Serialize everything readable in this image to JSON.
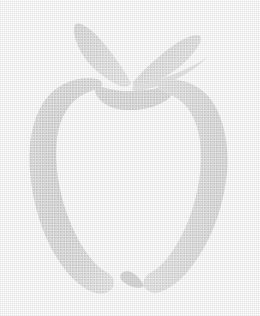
{
  "canvas": {
    "width": 260,
    "height": 316,
    "background_color": "#ffffff",
    "alt_text": "Apple outline graphic"
  },
  "graphic": {
    "name": "apple-outline-logo",
    "subject": "apple",
    "style": "outline silhouette, halftone dithered",
    "fill_color": "#e2e2e2",
    "fill_color_light": "#ececec",
    "fill_color_dark": "#d8d8d8",
    "stroke_color": "none",
    "parts": [
      {
        "id": "leaf-left",
        "label": "Left Leaf",
        "color": "#dedede"
      },
      {
        "id": "leaf-right",
        "label": "Right Leaf",
        "color": "#e4e4e4"
      },
      {
        "id": "calyx",
        "label": "Calyx Cup",
        "color": "#dcdcdc"
      },
      {
        "id": "body-left",
        "label": "Left Body Stroke",
        "color": "#dadada"
      },
      {
        "id": "body-right",
        "label": "Right Body Stroke",
        "color": "#e6e6e6"
      }
    ]
  },
  "paths": {
    "leaf_left": "M131,83 C124,70 112,52 99,38 C90,28 80,22 76,24 C72,27 74,38 80,50 C88,66 104,78 118,85 C124,88 129,87 131,83 Z",
    "leaf_right": "M133,82 C143,71 158,56 174,45 C186,37 197,33 200,36 C203,39 198,48 189,58 C176,72 157,82 142,87 C136,89 132,86 133,82 Z",
    "leaf_right_lower": "M134,86 C148,83 170,77 188,68 C199,63 207,58 209,55 C205,60 196,68 184,75 C168,84 148,90 136,91 C132,91 131,88 134,86 Z",
    "calyx": "M95,91 C97,100 108,109 126,110 C148,111 168,103 173,93 C176,87 172,84 166,86 C152,90 130,93 114,90 C105,88 99,86 96,87 C94,88 94,89 95,91 Z",
    "body_left": "M97,79 C78,76 58,83 46,99 C33,116 28,142 30,170 C32,202 42,234 57,258 C69,277 83,290 96,293 C104,295 110,292 113,287 C116,281 113,276 106,272 C92,264 78,243 68,217 C58,190 54,161 57,138 C60,116 70,101 84,94 C92,90 98,89 101,87 C104,85 102,80 97,79 Z",
    "body_right": "M163,80 C182,77 201,85 212,101 C224,119 229,145 227,172 C224,203 214,233 199,256 C187,275 173,288 160,292 C152,294 146,291 144,286 C142,280 146,275 152,272 C166,264 179,244 189,219 C199,193 203,164 200,141 C197,119 188,104 175,97 C167,93 161,91 159,89 C156,86 158,81 163,80 Z",
    "bottom_hook_right": "M144,286 C141,280 138,276 133,273 C128,270 123,271 121,274 C119,278 122,282 128,285 C134,288 141,289 144,286 Z"
  }
}
